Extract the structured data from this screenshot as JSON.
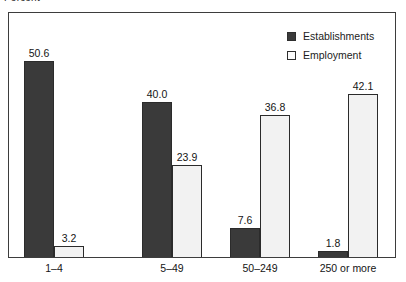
{
  "chart_data": {
    "type": "bar",
    "title": "",
    "ylabel": "Percent",
    "xlabel": "",
    "ylim": [
      0,
      50.6
    ],
    "grid": false,
    "legend_position": "top-right-inside",
    "categories": [
      "1–4",
      "5–49",
      "50–249",
      "250 or more"
    ],
    "series": [
      {
        "name": "Establishments",
        "color": "#3a3a3a",
        "values": [
          50.6,
          40.0,
          7.6,
          1.8
        ],
        "labels": [
          "50.6",
          "40.0",
          "7.6",
          "1.8"
        ]
      },
      {
        "name": "Employment",
        "color": "#f2f2f2",
        "values": [
          3.2,
          23.9,
          36.8,
          42.1
        ],
        "labels": [
          "3.2",
          "23.9",
          "36.8",
          "42.1"
        ]
      }
    ]
  },
  "legend": {
    "items": [
      {
        "label": "Establishments",
        "swatch": "dark"
      },
      {
        "label": "Employment",
        "swatch": "light"
      }
    ]
  },
  "axis": {
    "y_caption": "Percent",
    "x_tick_labels": [
      "1–4",
      "5–49",
      "50–249",
      "250 or more"
    ]
  }
}
